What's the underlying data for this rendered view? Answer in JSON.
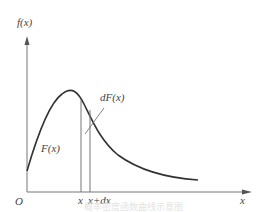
{
  "figure": {
    "y_axis_label": "f(x)",
    "x_axis_label": "x",
    "origin_label": "O",
    "curve_label": "F(x)",
    "differential_label": "dF(x)",
    "x_tick_label": "x",
    "x_dx_tick_label": "x+dx",
    "caption": "概率密度函数曲线示意图"
  },
  "colors": {
    "axis": "#777777",
    "curve": "#333333",
    "text": "#444444"
  }
}
